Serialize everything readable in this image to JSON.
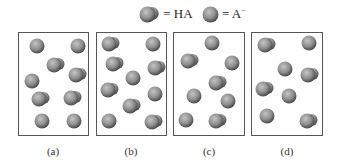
{
  "legend": {
    "items": [
      {
        "type": "HA",
        "text": "= HA"
      },
      {
        "type": "A-",
        "text": "= A",
        "superscript": "−"
      }
    ]
  },
  "colors": {
    "particle_light": "#c4c4c4",
    "particle_mid": "#8e8e8e",
    "particle_dark": "#4a4a4a",
    "border": "#555555"
  },
  "panels": [
    {
      "label": "(a)",
      "counts": {
        "HA": 4,
        "A-": 4
      },
      "particles": [
        {
          "type": "A-",
          "x": 10,
          "y": 5
        },
        {
          "type": "A-",
          "x": 51,
          "y": 5
        },
        {
          "type": "HA",
          "x": 27,
          "y": 24
        },
        {
          "type": "HA",
          "x": 49,
          "y": 34
        },
        {
          "type": "A-",
          "x": 5,
          "y": 40
        },
        {
          "type": "HA",
          "x": 12,
          "y": 58
        },
        {
          "type": "HA",
          "x": 44,
          "y": 57
        },
        {
          "type": "A-",
          "x": 15,
          "y": 80
        },
        {
          "type": "A-",
          "x": 47,
          "y": 80
        }
      ]
    },
    {
      "label": "(b)",
      "counts": {
        "HA": 6,
        "A-": 4
      },
      "particles": [
        {
          "type": "HA",
          "x": 4,
          "y": 3
        },
        {
          "type": "A-",
          "x": 48,
          "y": 3
        },
        {
          "type": "HA",
          "x": 8,
          "y": 23
        },
        {
          "type": "HA",
          "x": 50,
          "y": 27
        },
        {
          "type": "A-",
          "x": 28,
          "y": 37
        },
        {
          "type": "HA",
          "x": 3,
          "y": 49
        },
        {
          "type": "A-",
          "x": 50,
          "y": 53
        },
        {
          "type": "HA",
          "x": 25,
          "y": 65
        },
        {
          "type": "A-",
          "x": 4,
          "y": 80
        },
        {
          "type": "HA",
          "x": 47,
          "y": 81
        }
      ]
    },
    {
      "label": "(c)",
      "counts": {
        "HA": 3,
        "A-": 5
      },
      "particles": [
        {
          "type": "A-",
          "x": 30,
          "y": 2
        },
        {
          "type": "HA",
          "x": 6,
          "y": 20
        },
        {
          "type": "A-",
          "x": 50,
          "y": 22
        },
        {
          "type": "HA",
          "x": 34,
          "y": 42
        },
        {
          "type": "A-",
          "x": 12,
          "y": 55
        },
        {
          "type": "A-",
          "x": 46,
          "y": 60
        },
        {
          "type": "A-",
          "x": 4,
          "y": 79
        },
        {
          "type": "HA",
          "x": 34,
          "y": 80
        }
      ]
    },
    {
      "label": "(d)",
      "counts": {
        "HA": 4,
        "A-": 4
      },
      "particles": [
        {
          "type": "HA",
          "x": 5,
          "y": 4
        },
        {
          "type": "A-",
          "x": 49,
          "y": 2
        },
        {
          "type": "A-",
          "x": 25,
          "y": 28
        },
        {
          "type": "HA",
          "x": 48,
          "y": 34
        },
        {
          "type": "HA",
          "x": 3,
          "y": 48
        },
        {
          "type": "A-",
          "x": 29,
          "y": 55
        },
        {
          "type": "A-",
          "x": 7,
          "y": 75
        },
        {
          "type": "HA",
          "x": 47,
          "y": 80
        }
      ]
    }
  ]
}
